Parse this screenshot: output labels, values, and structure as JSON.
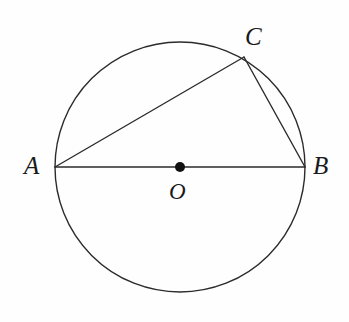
{
  "figure": {
    "type": "euclidean-geometry-diagram",
    "canvas": {
      "width": 349,
      "height": 322
    },
    "background_color": "#fefefe",
    "stroke_color": "#2b2b2b",
    "label_color": "#1a1a1a",
    "stroke_width": 1.4
  },
  "circle": {
    "name": "circle-O",
    "center": {
      "x": 180,
      "y": 167
    },
    "radius": 125,
    "fill": "none",
    "stroke_color": "#2b2b2b",
    "stroke_width": 1.4
  },
  "points": [
    {
      "id": "A",
      "label": "A",
      "x": 55,
      "y": 167,
      "marker": "none",
      "label_x": 24,
      "label_y": 153,
      "label_size": "sz-main"
    },
    {
      "id": "B",
      "label": "B",
      "x": 305,
      "y": 167,
      "marker": "none",
      "label_x": 313,
      "label_y": 153,
      "label_size": "sz-main"
    },
    {
      "id": "C",
      "label": "C",
      "x": 244,
      "y": 57,
      "marker": "none",
      "label_x": 245,
      "label_y": 24,
      "label_size": "sz-main"
    },
    {
      "id": "O",
      "label": "O",
      "x": 180,
      "y": 167,
      "marker": "filled-dot",
      "marker_radius": 5,
      "marker_fill": "#111111",
      "label_x": 169,
      "label_y": 180,
      "label_size": "sz-center"
    }
  ],
  "segments": [
    {
      "id": "AB",
      "name": "diameter-ab",
      "from": "A",
      "to": "B",
      "x1": 55,
      "y1": 167,
      "x2": 305,
      "y2": 167,
      "role": "diameter"
    },
    {
      "id": "AC",
      "name": "chord-ac",
      "from": "A",
      "to": "C",
      "x1": 55,
      "y1": 167,
      "x2": 244,
      "y2": 57,
      "role": "chord"
    },
    {
      "id": "CB",
      "name": "chord-cb",
      "from": "C",
      "to": "B",
      "x1": 244,
      "y1": 57,
      "x2": 305,
      "y2": 167,
      "role": "chord"
    }
  ]
}
